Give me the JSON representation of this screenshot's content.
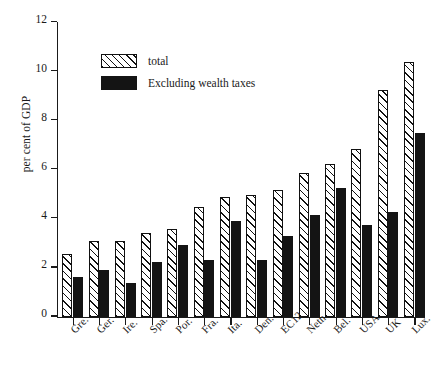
{
  "chart_data": {
    "type": "bar",
    "title": "",
    "subtitle": "",
    "xlabel": "",
    "ylabel": "per cent of GDP",
    "ylim": [
      0,
      12
    ],
    "ytick_labels": [
      "0",
      "2",
      "4",
      "6",
      "8",
      "10",
      "12"
    ],
    "ytick_values": [
      0,
      2,
      4,
      6,
      8,
      10,
      12
    ],
    "grid": false,
    "legend_position": "upper-left-inside",
    "categories": [
      "Gre.",
      "Ger.",
      "Ire.",
      "Spa.",
      "Por.",
      "Fra.",
      "Ita.",
      "Den.",
      "EC12",
      "Neth.",
      "Bel.",
      "USA",
      "UK",
      "Lux."
    ],
    "series": [
      {
        "name": "total",
        "fill": "diagonal-hatch",
        "color": "#111111",
        "values": [
          2.55,
          3.07,
          3.07,
          3.42,
          3.55,
          4.45,
          4.87,
          4.95,
          5.15,
          5.85,
          6.22,
          6.83,
          9.22,
          10.38
        ]
      },
      {
        "name": "Excluding wealth taxes",
        "fill": "solid",
        "color": "#141414",
        "values": [
          1.63,
          1.9,
          1.35,
          2.21,
          2.9,
          2.32,
          3.9,
          2.31,
          3.3,
          4.14,
          5.22,
          3.74,
          4.28,
          7.47
        ]
      }
    ]
  },
  "axes": {
    "y_title": "per cent of GDP"
  },
  "legend": {
    "items": [
      {
        "label": "total",
        "swatch": "hatched-swatch"
      },
      {
        "label": "Excluding wealth taxes",
        "swatch": "solid-black-swatch"
      }
    ]
  },
  "colors": {
    "ink": "#1a1a1a",
    "bar_outline": "#111111",
    "bar_solid": "#141414",
    "background": "#ffffff"
  }
}
